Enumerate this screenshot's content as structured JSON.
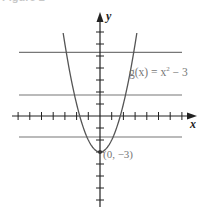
{
  "figure": {
    "caption": "Figure 2"
  },
  "chart_data": {
    "type": "line",
    "title": "",
    "xlabel": "x",
    "ylabel": "y",
    "function_label": "g(x) = x² − 3",
    "function_label_parts": {
      "prefix": "g(x) = x",
      "exponent": "2",
      "suffix": " − 3"
    },
    "series": [
      {
        "name": "g(x) = x^2 - 3",
        "x": [
          -3,
          -2.5,
          -2,
          -1.5,
          -1,
          -0.5,
          0,
          0.5,
          1,
          1.5,
          2,
          2.5,
          3
        ],
        "values": [
          6,
          3.25,
          1,
          -0.75,
          -2,
          -2.75,
          -3,
          -2.75,
          -2,
          -0.75,
          1,
          3.25,
          6
        ]
      }
    ],
    "annotations": [
      {
        "point": [
          0,
          -3
        ],
        "label": "(0, −3)"
      }
    ],
    "horizontal_guides_y": [
      5.3,
      1.75,
      -1.75
    ],
    "xlim": [
      -7.5,
      8
    ],
    "ylim": [
      -7.5,
      8.5
    ],
    "x_ticks": [
      -7,
      -6,
      -5,
      -4,
      -3,
      -2,
      -1,
      1,
      2,
      3,
      4,
      5,
      6,
      7
    ],
    "y_ticks": [
      -7,
      -6,
      -5,
      -4,
      -3,
      -2,
      -1,
      1,
      2,
      3,
      4,
      5,
      6,
      7
    ],
    "grid": false,
    "legend": "none",
    "colors": {
      "axis": "#222222",
      "curve": "#555555",
      "guide_lines": "#777777",
      "label": "#777777"
    }
  }
}
